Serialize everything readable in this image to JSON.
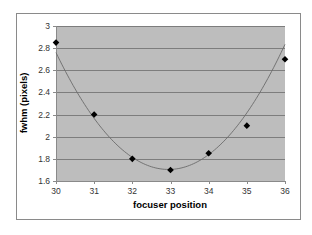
{
  "chart_data": {
    "type": "scatter",
    "title": "",
    "xlabel": "focuser position",
    "ylabel": "fwhm (pixels)",
    "xlim": [
      30,
      36
    ],
    "ylim": [
      1.6,
      3
    ],
    "x_ticks": [
      30,
      31,
      32,
      33,
      34,
      35,
      36
    ],
    "y_ticks": [
      1.6,
      1.8,
      2,
      2.2,
      2.4,
      2.6,
      2.8,
      3
    ],
    "y_tick_labels": [
      "1.6",
      "1.8",
      "2",
      "2.2",
      "2.4",
      "2.6",
      "2.8",
      "3"
    ],
    "grid": {
      "horizontal": true,
      "vertical": false
    },
    "legend": null,
    "series": [
      {
        "name": "measured fwhm",
        "style": "markers",
        "marker": "diamond",
        "x": [
          30,
          31,
          32,
          33,
          34,
          35,
          36
        ],
        "y": [
          2.85,
          2.2,
          1.8,
          1.7,
          1.85,
          2.1,
          2.7
        ]
      },
      {
        "name": "fitted parabola",
        "style": "line",
        "curve": "quadratic trendline",
        "fit": {
          "a": 0.1214,
          "b": -8.0,
          "c": 133.5
        }
      }
    ],
    "colors": {
      "plot_background": "#bdbdbd",
      "gridline": "#7d7d7d",
      "frame": "#8a8a8a",
      "marker": "#000000",
      "curve": "#6b6b6b"
    }
  }
}
